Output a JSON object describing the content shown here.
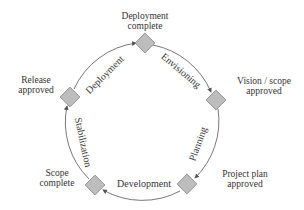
{
  "diagram": {
    "type": "cycle",
    "colors": {
      "diamond_fill": "#bdbdbd",
      "diamond_stroke": "#8a8a8a",
      "arc": "#555555",
      "text": "#333333"
    },
    "milestones": [
      {
        "id": "deployment-complete",
        "line1": "Deployment",
        "line2": "complete"
      },
      {
        "id": "vision-scope-approved",
        "line1": "Vision / scope",
        "line2": "approved"
      },
      {
        "id": "project-plan-approved",
        "line1": "Project plan",
        "line2": "approved"
      },
      {
        "id": "scope-complete",
        "line1": "Scope",
        "line2": "complete"
      },
      {
        "id": "release-approved",
        "line1": "Release",
        "line2": "approved"
      }
    ],
    "phases": [
      {
        "id": "envisioning",
        "label": "Envisioning"
      },
      {
        "id": "planning",
        "label": "Planning"
      },
      {
        "id": "development",
        "label": "Development"
      },
      {
        "id": "stabilization",
        "label": "Stabilization"
      },
      {
        "id": "deployment",
        "label": "Deployment"
      }
    ]
  }
}
